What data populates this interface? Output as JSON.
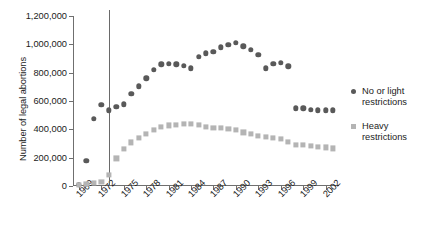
{
  "chart_data": {
    "type": "scatter",
    "title": "",
    "xlabel": "",
    "ylabel": "Number of legal abortions",
    "xlim": [
      1968.2,
      2003.8
    ],
    "ylim": [
      0,
      1200000
    ],
    "grid": false,
    "legend_position": "right",
    "y_ticks": [
      0,
      200000,
      400000,
      600000,
      800000,
      1000000,
      1200000
    ],
    "y_tick_labels": [
      "0",
      "200,000",
      "400,000",
      "600,000",
      "800,000",
      "1,000,000",
      "1,200,000"
    ],
    "x_ticks": [
      1969,
      1972,
      1975,
      1978,
      1981,
      1984,
      1987,
      1990,
      1993,
      1996,
      1999,
      2002
    ],
    "x_tick_labels": [
      "1969",
      "1972",
      "1975",
      "1978",
      "1981",
      "1984",
      "1987",
      "1990",
      "1993",
      "1996",
      "1999",
      "2002"
    ],
    "annotations": [
      {
        "name": "roe-v-wade-line",
        "type": "vline",
        "x": 1973,
        "color": "#6a6a6a"
      }
    ],
    "series": [
      {
        "name": "No or light restrictions",
        "marker": "circle",
        "color": "#595959",
        "points": [
          {
            "x": 1969,
            "y": 8000
          },
          {
            "x": 1970,
            "y": 180000
          },
          {
            "x": 1971,
            "y": 475000
          },
          {
            "x": 1972,
            "y": 575000
          },
          {
            "x": 1973,
            "y": 535000
          },
          {
            "x": 1974,
            "y": 560000
          },
          {
            "x": 1975,
            "y": 578000
          },
          {
            "x": 1976,
            "y": 650000
          },
          {
            "x": 1977,
            "y": 705000
          },
          {
            "x": 1978,
            "y": 760000
          },
          {
            "x": 1979,
            "y": 820000
          },
          {
            "x": 1980,
            "y": 858000
          },
          {
            "x": 1981,
            "y": 862000
          },
          {
            "x": 1982,
            "y": 860000
          },
          {
            "x": 1983,
            "y": 848000
          },
          {
            "x": 1984,
            "y": 832000
          },
          {
            "x": 1985,
            "y": 912000
          },
          {
            "x": 1986,
            "y": 938000
          },
          {
            "x": 1987,
            "y": 948000
          },
          {
            "x": 1988,
            "y": 980000
          },
          {
            "x": 1989,
            "y": 995000
          },
          {
            "x": 1990,
            "y": 1010000
          },
          {
            "x": 1991,
            "y": 985000
          },
          {
            "x": 1992,
            "y": 960000
          },
          {
            "x": 1993,
            "y": 925000
          },
          {
            "x": 1994,
            "y": 830000
          },
          {
            "x": 1995,
            "y": 862000
          },
          {
            "x": 1996,
            "y": 870000
          },
          {
            "x": 1997,
            "y": 845000
          },
          {
            "x": 1998,
            "y": 548000
          },
          {
            "x": 1999,
            "y": 548000
          },
          {
            "x": 2000,
            "y": 540000
          },
          {
            "x": 2001,
            "y": 535000
          },
          {
            "x": 2002,
            "y": 535000
          },
          {
            "x": 2003,
            "y": 535000
          }
        ]
      },
      {
        "name": "Heavy restrictions",
        "marker": "square",
        "color": "#b4b4b4",
        "points": [
          {
            "x": 1969,
            "y": 6000
          },
          {
            "x": 1970,
            "y": 12000
          },
          {
            "x": 1971,
            "y": 22000
          },
          {
            "x": 1972,
            "y": 28000
          },
          {
            "x": 1973,
            "y": 80000
          },
          {
            "x": 1974,
            "y": 195000
          },
          {
            "x": 1975,
            "y": 262000
          },
          {
            "x": 1976,
            "y": 308000
          },
          {
            "x": 1977,
            "y": 340000
          },
          {
            "x": 1978,
            "y": 368000
          },
          {
            "x": 1979,
            "y": 398000
          },
          {
            "x": 1980,
            "y": 418000
          },
          {
            "x": 1981,
            "y": 428000
          },
          {
            "x": 1982,
            "y": 432000
          },
          {
            "x": 1983,
            "y": 438000
          },
          {
            "x": 1984,
            "y": 440000
          },
          {
            "x": 1985,
            "y": 430000
          },
          {
            "x": 1986,
            "y": 418000
          },
          {
            "x": 1987,
            "y": 412000
          },
          {
            "x": 1988,
            "y": 410000
          },
          {
            "x": 1989,
            "y": 402000
          },
          {
            "x": 1990,
            "y": 398000
          },
          {
            "x": 1991,
            "y": 378000
          },
          {
            "x": 1992,
            "y": 368000
          },
          {
            "x": 1993,
            "y": 355000
          },
          {
            "x": 1994,
            "y": 348000
          },
          {
            "x": 1995,
            "y": 340000
          },
          {
            "x": 1996,
            "y": 330000
          },
          {
            "x": 1997,
            "y": 310000
          },
          {
            "x": 1998,
            "y": 290000
          },
          {
            "x": 1999,
            "y": 288000
          },
          {
            "x": 2000,
            "y": 282000
          },
          {
            "x": 2001,
            "y": 276000
          },
          {
            "x": 2002,
            "y": 272000
          },
          {
            "x": 2003,
            "y": 265000
          }
        ]
      }
    ]
  },
  "legend": {
    "items": [
      {
        "label": "No or light restrictions",
        "marker": "circle"
      },
      {
        "label": "Heavy restrictions",
        "marker": "square"
      }
    ]
  }
}
